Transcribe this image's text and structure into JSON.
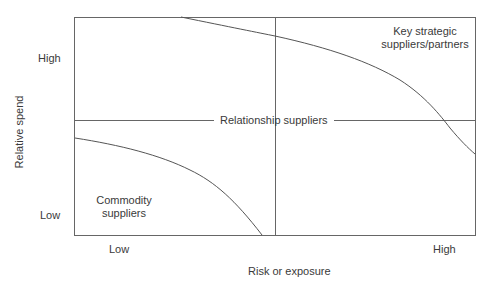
{
  "diagram": {
    "y_axis": {
      "label": "Relative spend",
      "high": "High",
      "low": "Low"
    },
    "x_axis": {
      "label": "Risk or exposure",
      "low": "Low",
      "high": "High"
    },
    "regions": {
      "top_right": [
        "Key strategic",
        "suppliers/partners"
      ],
      "middle": "Relationship suppliers",
      "bottom_left": [
        "Commodity",
        "suppliers"
      ]
    },
    "colors": {
      "line": "#555555",
      "text": "#3a3a3a",
      "background": "#ffffff"
    }
  }
}
